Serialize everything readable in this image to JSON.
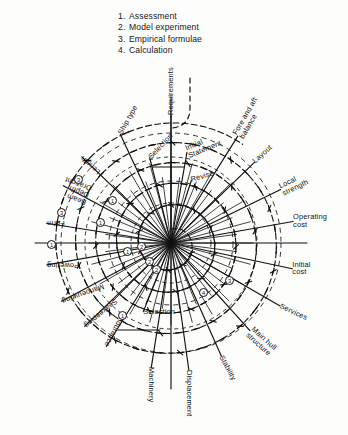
{
  "figure": {
    "type": "radial-spiral-diagram"
  },
  "legend": {
    "items": [
      {
        "num": "1.",
        "label": "Assessment"
      },
      {
        "num": "2.",
        "label": "Model experiment"
      },
      {
        "num": "3.",
        "label": "Empirical formulae"
      },
      {
        "num": "4.",
        "label": "Calculation"
      }
    ]
  },
  "spokes": [
    {
      "label": "Requirements",
      "angle": -90,
      "r": 128,
      "rot": -90,
      "two": false
    },
    {
      "label": "Ship type",
      "angle": -115,
      "r": 120,
      "rot": -60,
      "two": false
    },
    {
      "label": "Selection",
      "angle": -104,
      "r": 88,
      "rot": -47,
      "two": false
    },
    {
      "label": "Initial\nStatement",
      "angle": -80,
      "r": 92,
      "rot": -22,
      "two": true
    },
    {
      "label": "Revise",
      "angle": -72,
      "r": 66,
      "rot": -16,
      "two": false
    },
    {
      "label": "Fore and aft\nbalance",
      "angle": -58,
      "r": 126,
      "rot": -60,
      "two": true
    },
    {
      "label": "Layout",
      "angle": -44,
      "r": 116,
      "rot": -42,
      "two": false
    },
    {
      "label": "Local\nstrength",
      "angle": -26,
      "r": 122,
      "rot": -26,
      "two": true
    },
    {
      "label": "Operating\ncost",
      "angle": -10,
      "r": 124,
      "rot": 0,
      "two": true
    },
    {
      "label": "Initial\ncost",
      "angle": 12,
      "r": 124,
      "rot": 0,
      "two": true
    },
    {
      "label": "Services",
      "angle": 30,
      "r": 126,
      "rot": 25,
      "two": false
    },
    {
      "label": "Main hull\nstructure",
      "angle": 48,
      "r": 118,
      "rot": 42,
      "two": true
    },
    {
      "label": "Stability",
      "angle": 66,
      "r": 124,
      "rot": 62,
      "two": false
    },
    {
      "label": "Displacement",
      "angle": 82,
      "r": 128,
      "rot": 90,
      "two": false
    },
    {
      "label": "Machinery",
      "angle": 99,
      "r": 126,
      "rot": 90,
      "two": false
    },
    {
      "label": "Selection",
      "angle": 112,
      "r": 74,
      "rot": 0,
      "two": false
    },
    {
      "label": "Endurance",
      "angle": 122,
      "r": 122,
      "rot": 118,
      "two": false
    },
    {
      "label": "Seakeeping",
      "angle": 136,
      "r": 120,
      "rot": 140,
      "two": false
    },
    {
      "label": "Manoeuvring",
      "angle": 152,
      "r": 124,
      "rot": 160,
      "two": false
    },
    {
      "label": "Powering",
      "angle": 170,
      "r": 126,
      "rot": 180,
      "two": false
    },
    {
      "label": "Form",
      "angle": -171,
      "r": 126,
      "rot": 180,
      "two": false
    },
    {
      "label": "Beam\nDepth\nDraught",
      "angle": -152,
      "r": 122,
      "rot": 200,
      "two": true
    },
    {
      "label": "Length",
      "angle": -136,
      "r": 124,
      "rot": 222,
      "two": false
    }
  ],
  "markers": [
    {
      "num": "3",
      "x": 74,
      "y": 175
    },
    {
      "num": "3",
      "x": 57,
      "y": 208
    },
    {
      "num": "1",
      "x": 47,
      "y": 240
    },
    {
      "num": "1",
      "x": 96,
      "y": 218
    },
    {
      "num": "1",
      "x": 108,
      "y": 196
    },
    {
      "num": "1",
      "x": 123,
      "y": 247
    },
    {
      "num": "2",
      "x": 137,
      "y": 242
    },
    {
      "num": "2",
      "x": 145,
      "y": 257
    },
    {
      "num": "2",
      "x": 152,
      "y": 265
    },
    {
      "num": "1",
      "x": 118,
      "y": 311
    },
    {
      "num": "4",
      "x": 199,
      "y": 288
    },
    {
      "num": "3",
      "x": 225,
      "y": 276
    }
  ],
  "geometry": {
    "center_x": 171,
    "center_y": 243,
    "outer_radius": 128,
    "accent_color": "#111111",
    "background_color": "#fdfdfc"
  }
}
